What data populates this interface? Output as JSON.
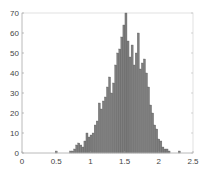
{
  "chart_data": {
    "type": "bar",
    "title": "",
    "xlabel": "",
    "ylabel": "",
    "xlim": [
      0,
      2.5
    ],
    "ylim": [
      0,
      70
    ],
    "grid": false,
    "legend": null,
    "bar_color": "#7f7f7f",
    "bar_edge_color": "#555555",
    "xticks": [
      0,
      0.5,
      1,
      1.5,
      2,
      2.5
    ],
    "xtick_labels": [
      "0",
      "0.5",
      "1",
      "1.5",
      "2",
      "2.5"
    ],
    "yticks": [
      0,
      10,
      20,
      30,
      40,
      50,
      60,
      70
    ],
    "ytick_labels": [
      "0",
      "10",
      "20",
      "30",
      "40",
      "50",
      "60",
      "70"
    ],
    "bin_width": 0.03,
    "bins": [
      {
        "x": 0.5,
        "count": 1
      },
      {
        "x": 0.71,
        "count": 1
      },
      {
        "x": 0.74,
        "count": 1
      },
      {
        "x": 0.77,
        "count": 2
      },
      {
        "x": 0.8,
        "count": 4
      },
      {
        "x": 0.83,
        "count": 5
      },
      {
        "x": 0.86,
        "count": 4
      },
      {
        "x": 0.89,
        "count": 3
      },
      {
        "x": 0.92,
        "count": 6
      },
      {
        "x": 0.95,
        "count": 10
      },
      {
        "x": 0.98,
        "count": 8
      },
      {
        "x": 1.01,
        "count": 9
      },
      {
        "x": 1.04,
        "count": 10
      },
      {
        "x": 1.07,
        "count": 14
      },
      {
        "x": 1.1,
        "count": 16
      },
      {
        "x": 1.13,
        "count": 25
      },
      {
        "x": 1.16,
        "count": 22
      },
      {
        "x": 1.19,
        "count": 26
      },
      {
        "x": 1.22,
        "count": 28
      },
      {
        "x": 1.25,
        "count": 33
      },
      {
        "x": 1.28,
        "count": 38
      },
      {
        "x": 1.31,
        "count": 30
      },
      {
        "x": 1.34,
        "count": 35
      },
      {
        "x": 1.37,
        "count": 44
      },
      {
        "x": 1.4,
        "count": 50
      },
      {
        "x": 1.43,
        "count": 52
      },
      {
        "x": 1.46,
        "count": 58
      },
      {
        "x": 1.49,
        "count": 64
      },
      {
        "x": 1.52,
        "count": 70
      },
      {
        "x": 1.55,
        "count": 56
      },
      {
        "x": 1.58,
        "count": 48
      },
      {
        "x": 1.61,
        "count": 54
      },
      {
        "x": 1.64,
        "count": 44
      },
      {
        "x": 1.67,
        "count": 50
      },
      {
        "x": 1.7,
        "count": 60
      },
      {
        "x": 1.73,
        "count": 42
      },
      {
        "x": 1.76,
        "count": 45
      },
      {
        "x": 1.79,
        "count": 47
      },
      {
        "x": 1.82,
        "count": 40
      },
      {
        "x": 1.85,
        "count": 33
      },
      {
        "x": 1.88,
        "count": 24
      },
      {
        "x": 1.91,
        "count": 20
      },
      {
        "x": 1.94,
        "count": 14
      },
      {
        "x": 1.97,
        "count": 12
      },
      {
        "x": 2.0,
        "count": 7
      },
      {
        "x": 2.03,
        "count": 6
      },
      {
        "x": 2.06,
        "count": 3
      },
      {
        "x": 2.09,
        "count": 2
      },
      {
        "x": 2.12,
        "count": 2
      },
      {
        "x": 2.15,
        "count": 1
      },
      {
        "x": 2.3,
        "count": 1
      }
    ]
  }
}
